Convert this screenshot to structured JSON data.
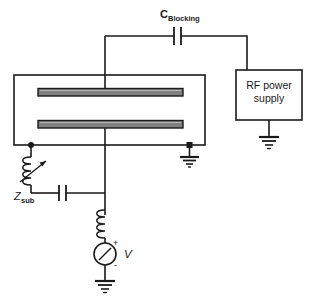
{
  "diagram": {
    "colors": {
      "wire": "#1a1a1a",
      "electrode_fill": "#808080",
      "electrode_stroke": "#1a1a1a",
      "background": "#ffffff",
      "text": "#1a1a1a"
    },
    "labels": {
      "blocking_cap_main": "C",
      "blocking_cap_sub": "Blocking",
      "rf_supply_line1": "RF power",
      "rf_supply_line2": "supply",
      "z_sub_main": "Z",
      "z_sub_sub": "sub",
      "source_label": "V",
      "source_plus": "+",
      "source_minus": "-"
    },
    "components": [
      {
        "name": "blocking-capacitor",
        "type": "capacitor",
        "label": "C Blocking"
      },
      {
        "name": "rf-power-supply",
        "type": "box",
        "label": "RF power supply"
      },
      {
        "name": "rf-supply-ground",
        "type": "ground",
        "label": ""
      },
      {
        "name": "plasma-chamber",
        "type": "chamber",
        "label": ""
      },
      {
        "name": "upper-electrode",
        "type": "electrode-plate",
        "label": ""
      },
      {
        "name": "lower-electrode",
        "type": "electrode-plate",
        "label": ""
      },
      {
        "name": "chamber-ground",
        "type": "ground",
        "label": ""
      },
      {
        "name": "variable-inductor",
        "type": "variable-inductor",
        "label": "Z sub"
      },
      {
        "name": "zsub-capacitor",
        "type": "capacitor",
        "label": ""
      },
      {
        "name": "bias-inductor",
        "type": "inductor",
        "label": ""
      },
      {
        "name": "voltage-source",
        "type": "voltage-source",
        "label": "V"
      },
      {
        "name": "source-ground",
        "type": "ground",
        "label": ""
      }
    ]
  }
}
